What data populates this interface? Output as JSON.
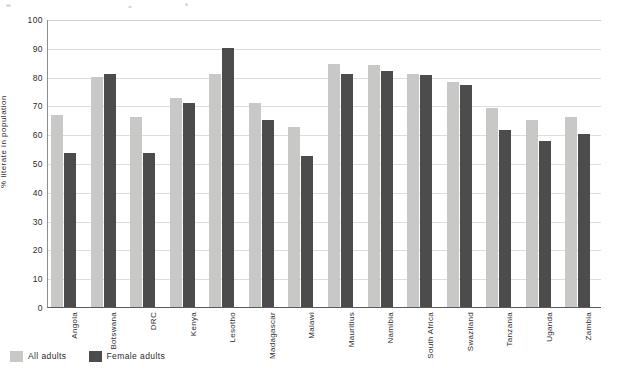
{
  "chart_data": {
    "type": "bar",
    "title": "",
    "subtitle": "",
    "xlabel": "",
    "ylabel": "% literate in population",
    "ylim": [
      0,
      100
    ],
    "yticks": [
      0,
      10,
      20,
      30,
      40,
      50,
      60,
      70,
      80,
      90,
      100
    ],
    "grid": true,
    "legend_position": "bottom-left",
    "categories": [
      "Angola",
      "Botswana",
      "DRC",
      "Kenya",
      "Lesotho",
      "Madagascar",
      "Malawi",
      "Mauritius",
      "Namibia",
      "South Africa",
      "Swaziland",
      "Tanzania",
      "Uganda",
      "Zambia"
    ],
    "series": [
      {
        "name": "All adults",
        "color": "#c8c8c6",
        "values": [
          66.5,
          80.0,
          66.0,
          72.5,
          81.0,
          71.0,
          62.5,
          84.5,
          84.0,
          81.0,
          78.0,
          69.0,
          65.0,
          66.0
        ]
      },
      {
        "name": "Female adults",
        "color": "#4c4c4c",
        "values": [
          53.5,
          81.0,
          53.5,
          71.0,
          90.0,
          65.0,
          52.5,
          81.0,
          82.0,
          80.5,
          77.0,
          61.5,
          57.5,
          60.0
        ]
      }
    ]
  },
  "legend": {
    "entries": [
      {
        "label": "All adults",
        "color": "#c8c8c6"
      },
      {
        "label": "Female adults",
        "color": "#4c4c4c"
      }
    ]
  },
  "axes": {
    "y_title": "% literate in population"
  }
}
